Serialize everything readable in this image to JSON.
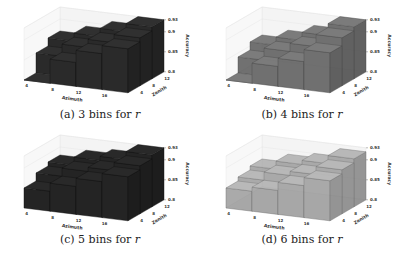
{
  "figure": {
    "panels": [
      {
        "id": "a",
        "caption_prefix": "(a) 3 bins for ",
        "caption_var": "r",
        "bar_color": "#2a2a2a",
        "edge_color": "#111111",
        "opacity": 1.0
      },
      {
        "id": "b",
        "caption_prefix": "(b) 4 bins for ",
        "caption_var": "r",
        "bar_color": "#5a5a5a",
        "edge_color": "#2a2a2a",
        "opacity": 0.85
      },
      {
        "id": "c",
        "caption_prefix": "(c) 5 bins for ",
        "caption_var": "r",
        "bar_color": "#242424",
        "edge_color": "#0e0e0e",
        "opacity": 1.0
      },
      {
        "id": "d",
        "caption_prefix": "(d) 6 bins for ",
        "caption_var": "r",
        "bar_color": "#8a8a8a",
        "edge_color": "#3a3a3a",
        "opacity": 0.7
      }
    ],
    "axes": {
      "xlabel": "Azimuth",
      "ylabel": "Zenith",
      "zlabel": "Accuracy",
      "xticks": [
        "4",
        "8",
        "12",
        "16"
      ],
      "yticks": [
        "4",
        "8",
        "12"
      ],
      "zticks": [
        "0.8",
        "0.85",
        "0.9",
        "0.93"
      ]
    }
  },
  "chart_data": [
    {
      "type": "bar3d",
      "title": "(a) 3 bins for r",
      "xlabel": "Azimuth",
      "ylabel": "Zenith",
      "zlabel": "Accuracy",
      "x": [
        4,
        8,
        12,
        16
      ],
      "y": [
        4,
        8,
        12
      ],
      "zlim": [
        0.8,
        0.93
      ],
      "values": [
        [
          0.8,
          0.86,
          0.89,
          0.91
        ],
        [
          0.85,
          0.88,
          0.9,
          0.92
        ],
        [
          0.87,
          0.89,
          0.91,
          0.93
        ]
      ]
    },
    {
      "type": "bar3d",
      "title": "(b) 4 bins for r",
      "xlabel": "Azimuth",
      "ylabel": "Zenith",
      "zlabel": "Accuracy",
      "x": [
        4,
        8,
        12,
        16
      ],
      "y": [
        4,
        8,
        12
      ],
      "zlim": [
        0.8,
        0.93
      ],
      "values": [
        [
          0.8,
          0.85,
          0.87,
          0.9
        ],
        [
          0.84,
          0.87,
          0.89,
          0.92
        ],
        [
          0.86,
          0.88,
          0.9,
          0.93
        ]
      ]
    },
    {
      "type": "bar3d",
      "title": "(c) 5 bins for r",
      "xlabel": "Azimuth",
      "ylabel": "Zenith",
      "zlabel": "Accuracy",
      "x": [
        4,
        8,
        12,
        16
      ],
      "y": [
        4,
        8,
        12
      ],
      "zlim": [
        0.8,
        0.93
      ],
      "values": [
        [
          0.85,
          0.87,
          0.89,
          0.91
        ],
        [
          0.87,
          0.89,
          0.9,
          0.92
        ],
        [
          0.88,
          0.9,
          0.91,
          0.93
        ]
      ]
    },
    {
      "type": "bar3d",
      "title": "(d) 6 bins for r",
      "xlabel": "Azimuth",
      "ylabel": "Zenith",
      "zlabel": "Accuracy",
      "x": [
        4,
        8,
        12,
        16
      ],
      "y": [
        4,
        8,
        12
      ],
      "zlim": [
        0.8,
        0.93
      ],
      "values": [
        [
          0.85,
          0.86,
          0.88,
          0.9
        ],
        [
          0.86,
          0.88,
          0.89,
          0.91
        ],
        [
          0.87,
          0.89,
          0.9,
          0.92
        ]
      ]
    }
  ]
}
